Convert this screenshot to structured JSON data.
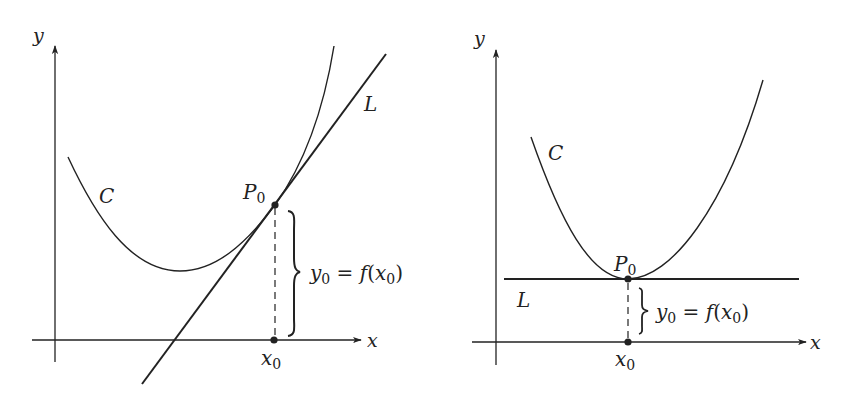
{
  "colors": {
    "ink": "#222222",
    "background": "#ffffff"
  },
  "panels": [
    {
      "id": "left",
      "description": "Curve C with non-horizontal tangent line L at P0",
      "axis_labels": {
        "x": "x",
        "y": "y"
      },
      "curve_label": "C",
      "line_label": "L",
      "point_label": {
        "main": "P",
        "sub": "0"
      },
      "xtick_label": {
        "main": "x",
        "sub": "0"
      },
      "brace_label": {
        "y": "y",
        "ysub": "0",
        "eq": " = ",
        "f": "f",
        "open": "(",
        "x": "x",
        "xsub": "0",
        "close": ")"
      }
    },
    {
      "id": "right",
      "description": "Curve C with horizontal tangent line L at minimum P0",
      "axis_labels": {
        "x": "x",
        "y": "y"
      },
      "curve_label": "C",
      "line_label": "L",
      "point_label": {
        "main": "P",
        "sub": "0"
      },
      "xtick_label": {
        "main": "x",
        "sub": "0"
      },
      "brace_label": {
        "y": "y",
        "ysub": "0",
        "eq": " = ",
        "f": "f",
        "open": "(",
        "x": "x",
        "xsub": "0",
        "close": ")"
      }
    }
  ]
}
